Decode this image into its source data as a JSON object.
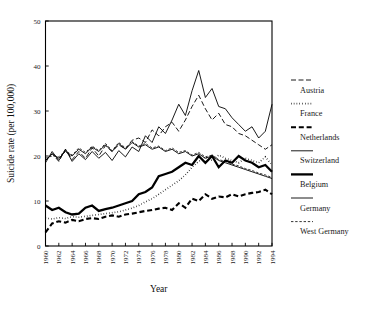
{
  "chart_data": {
    "type": "line",
    "title": "",
    "xlabel": "Year",
    "ylabel": "Suicide rate (per 100,000)",
    "xlim": [
      1960,
      1994
    ],
    "ylim": [
      0,
      50
    ],
    "ytick_labels": [
      "0",
      "10",
      "20",
      "30",
      "40",
      "50"
    ],
    "ytick_values": [
      0,
      10,
      20,
      30,
      40,
      50
    ],
    "xtick_labels": [
      "1960",
      "1962",
      "1964",
      "1966",
      "1968",
      "1970",
      "1972",
      "1974",
      "1976",
      "1978",
      "1980",
      "1982",
      "1984",
      "1986",
      "1988",
      "1990",
      "1992",
      "1994"
    ],
    "xtick_values": [
      1960,
      1962,
      1964,
      1966,
      1968,
      1970,
      1972,
      1974,
      1976,
      1978,
      1980,
      1982,
      1984,
      1986,
      1988,
      1990,
      1992,
      1994
    ],
    "grid": false,
    "legend_position": "right",
    "x": [
      1960,
      1961,
      1962,
      1963,
      1964,
      1965,
      1966,
      1967,
      1968,
      1969,
      1970,
      1971,
      1972,
      1973,
      1974,
      1975,
      1976,
      1977,
      1978,
      1979,
      1980,
      1981,
      1982,
      1983,
      1984,
      1985,
      1986,
      1987,
      1988,
      1989,
      1990,
      1991,
      1992,
      1993,
      1994
    ],
    "series": [
      {
        "name": "Austria",
        "style": "long-dash",
        "stroke_width": 0.9,
        "dash": "5,2.5",
        "values": [
          19.0,
          20.5,
          18.8,
          21.5,
          19.2,
          21.0,
          19.5,
          21.8,
          20.0,
          22.3,
          21.0,
          22.5,
          21.5,
          23.5,
          24.0,
          23.0,
          25.8,
          24.5,
          26.5,
          27.5,
          25.5,
          28.0,
          31.0,
          33.5,
          30.5,
          28.0,
          29.5,
          27.0,
          26.5,
          25.0,
          24.5,
          23.5,
          22.5,
          21.5,
          22.5
        ]
      },
      {
        "name": "France",
        "style": "dotted",
        "stroke_width": 1.6,
        "dash": "0.6,2.2",
        "values": [
          6.2,
          6.0,
          6.3,
          6.1,
          6.5,
          6.4,
          6.6,
          6.8,
          7.0,
          7.2,
          7.4,
          7.6,
          8.0,
          8.4,
          9.0,
          9.8,
          10.5,
          11.5,
          12.5,
          13.5,
          14.5,
          15.8,
          17.5,
          18.8,
          19.8,
          19.0,
          20.2,
          19.5,
          19.0,
          18.5,
          19.5,
          19.0,
          18.5,
          19.8,
          18.0
        ]
      },
      {
        "name": "Netherlands",
        "style": "dash",
        "stroke_width": 2.1,
        "dash": "5,2.8",
        "values": [
          3.0,
          5.0,
          5.5,
          5.2,
          5.8,
          5.5,
          6.0,
          6.2,
          6.0,
          6.5,
          6.8,
          6.5,
          7.0,
          7.2,
          7.5,
          7.8,
          8.0,
          8.3,
          8.5,
          8.0,
          9.5,
          8.5,
          10.5,
          10.0,
          11.5,
          10.5,
          11.0,
          10.8,
          11.5,
          11.0,
          11.5,
          11.8,
          12.0,
          12.5,
          11.5
        ]
      },
      {
        "name": "Switzerland",
        "style": "solid-thin",
        "stroke_width": 0.9,
        "dash": "none",
        "values": [
          18.5,
          21.0,
          19.0,
          21.5,
          18.8,
          20.5,
          19.2,
          21.0,
          19.5,
          20.8,
          19.0,
          21.2,
          19.8,
          22.0,
          21.0,
          24.5,
          23.0,
          26.5,
          25.0,
          28.0,
          31.5,
          29.0,
          34.5,
          39.0,
          33.0,
          35.0,
          31.0,
          30.5,
          28.5,
          27.0,
          25.5,
          26.5,
          24.0,
          25.5,
          31.5
        ]
      },
      {
        "name": "Belgium",
        "style": "solid-thick",
        "stroke_width": 2.3,
        "dash": "none",
        "values": [
          9.0,
          8.0,
          8.5,
          7.5,
          7.0,
          7.2,
          8.5,
          9.0,
          7.8,
          8.2,
          8.5,
          9.0,
          9.5,
          10.0,
          11.5,
          12.0,
          13.0,
          15.5,
          16.0,
          16.5,
          17.5,
          18.5,
          18.0,
          20.0,
          18.5,
          20.0,
          17.5,
          19.0,
          18.5,
          20.0,
          19.0,
          18.5,
          17.5,
          18.0,
          16.5
        ]
      },
      {
        "name": "Germany",
        "style": "solid-thin",
        "stroke_width": 0.9,
        "dash": "none",
        "values": [
          19.0,
          20.5,
          19.5,
          21.0,
          20.0,
          21.5,
          20.5,
          22.0,
          21.0,
          22.5,
          21.0,
          22.8,
          21.5,
          23.0,
          22.0,
          22.5,
          21.5,
          22.0,
          21.0,
          21.5,
          20.5,
          21.0,
          20.0,
          20.5,
          19.5,
          20.0,
          19.0,
          18.5,
          18.0,
          17.5,
          17.0,
          16.5,
          16.0,
          15.5,
          15.0
        ]
      },
      {
        "name": "West Germany",
        "style": "fine-dash",
        "stroke_width": 0.8,
        "dash": "2.4,1.8",
        "values": [
          19.5,
          20.0,
          19.8,
          21.2,
          20.2,
          21.8,
          20.8,
          22.2,
          21.2,
          22.8,
          21.2,
          23.0,
          21.8,
          23.2,
          22.2,
          22.8,
          21.8,
          22.2,
          21.2,
          21.8,
          20.8,
          21.2,
          20.2,
          20.8,
          19.8,
          20.2,
          19.2,
          18.8,
          18.2,
          17.8,
          17.2,
          16.8,
          16.2,
          15.8,
          15.2
        ]
      }
    ]
  },
  "legend": {
    "entries": [
      {
        "label": "Austria"
      },
      {
        "label": "France"
      },
      {
        "label": "Netherlands"
      },
      {
        "label": "Switzerland"
      },
      {
        "label": "Belgium"
      },
      {
        "label": "Germany"
      },
      {
        "label": "West Germany"
      }
    ]
  },
  "colors": {
    "ink": "#000000",
    "background": "#ffffff"
  }
}
